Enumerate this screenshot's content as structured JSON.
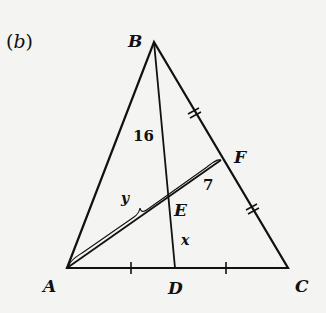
{
  "figure": {
    "tag_open": "(",
    "tag_letter": "b",
    "tag_close": ")"
  },
  "points": {
    "A": {
      "label": "A",
      "x": 67,
      "y": 268
    },
    "B": {
      "label": "B",
      "x": 154,
      "y": 42
    },
    "C": {
      "label": "C",
      "x": 288,
      "y": 268
    },
    "D": {
      "label": "D",
      "x": 175,
      "y": 268
    },
    "E": {
      "label": "E",
      "x": 171,
      "y": 196
    },
    "F": {
      "label": "F",
      "x": 221,
      "y": 160
    }
  },
  "segment_labels": {
    "BE": "16",
    "EF": "7",
    "ED": "x",
    "AE": "y"
  },
  "colors": {
    "ink": "#111111",
    "paper": "#f4f4f2"
  }
}
